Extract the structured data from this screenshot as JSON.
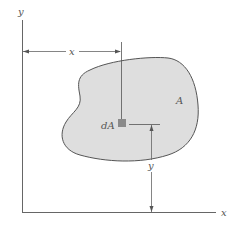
{
  "figure": {
    "axes": {
      "x_label": "x",
      "y_label": "y"
    },
    "region": {
      "label": "A",
      "fill_color": "#dedede",
      "outline_color": "#555555"
    },
    "element": {
      "label": "dA",
      "fill_color": "#8a8a8a"
    },
    "dimensions": {
      "horizontal_distance_label": "x",
      "vertical_distance_label": "y"
    },
    "line_color": "#666666"
  }
}
